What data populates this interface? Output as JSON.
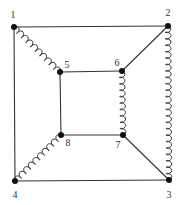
{
  "diagram": {
    "type": "graph",
    "colors": {
      "line": "#333333",
      "node": "#111111",
      "background": "#ffffff"
    },
    "nodes": [
      {
        "id": "1",
        "label": "1",
        "x": 14,
        "y": 27,
        "lx": 13,
        "ly": 18
      },
      {
        "id": "2",
        "label": "2",
        "x": 168,
        "y": 26,
        "lx": 168,
        "ly": 16
      },
      {
        "id": "3",
        "label": "3",
        "x": 169,
        "y": 180,
        "lx": 169,
        "ly": 198
      },
      {
        "id": "4",
        "label": "4",
        "x": 15,
        "y": 181,
        "lx": 15,
        "ly": 198
      },
      {
        "id": "5",
        "label": "5",
        "x": 60,
        "y": 72,
        "lx": 67,
        "ly": 68
      },
      {
        "id": "6",
        "label": "6",
        "x": 122,
        "y": 71,
        "lx": 117,
        "ly": 66
      },
      {
        "id": "7",
        "label": "7",
        "x": 123,
        "y": 135,
        "lx": 118,
        "ly": 148
      },
      {
        "id": "8",
        "label": "8",
        "x": 61,
        "y": 135,
        "lx": 68,
        "ly": 146
      }
    ],
    "edges": [
      {
        "from": "1",
        "to": "2",
        "style": "plain"
      },
      {
        "from": "1",
        "to": "4",
        "style": "plain"
      },
      {
        "from": "4",
        "to": "3",
        "style": "plain"
      },
      {
        "from": "2",
        "to": "3",
        "style": "wavy"
      },
      {
        "from": "1",
        "to": "5",
        "style": "wavy"
      },
      {
        "from": "4",
        "to": "8",
        "style": "wavy"
      },
      {
        "from": "2",
        "to": "6",
        "style": "plain"
      },
      {
        "from": "7",
        "to": "3",
        "style": "plain"
      },
      {
        "from": "5",
        "to": "6",
        "style": "plain"
      },
      {
        "from": "5",
        "to": "8",
        "style": "plain"
      },
      {
        "from": "8",
        "to": "7",
        "style": "plain"
      },
      {
        "from": "6",
        "to": "7",
        "style": "wavy"
      }
    ]
  }
}
